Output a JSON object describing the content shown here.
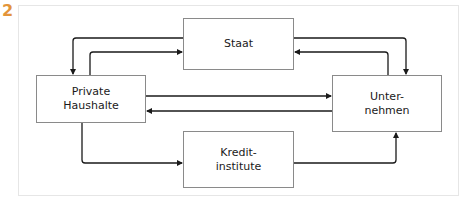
{
  "figure": {
    "number": "2",
    "number_color": "#e3943a"
  },
  "nodes": {
    "staat": {
      "label": "Staat"
    },
    "private_haushalte": {
      "label": "Private\nHaushalte"
    },
    "unternehmen": {
      "label": "Unter-\nnehmen"
    },
    "kreditinstitute": {
      "label": "Kredit-\ninstitute"
    }
  },
  "edges": [
    {
      "from": "Staat",
      "to": "Private Haushalte"
    },
    {
      "from": "Private Haushalte",
      "to": "Staat"
    },
    {
      "from": "Staat",
      "to": "Unternehmen"
    },
    {
      "from": "Unternehmen",
      "to": "Staat"
    },
    {
      "from": "Private Haushalte",
      "to": "Unternehmen"
    },
    {
      "from": "Unternehmen",
      "to": "Private Haushalte"
    },
    {
      "from": "Private Haushalte",
      "to": "Kreditinstitute"
    },
    {
      "from": "Kreditinstitute",
      "to": "Unternehmen"
    }
  ]
}
